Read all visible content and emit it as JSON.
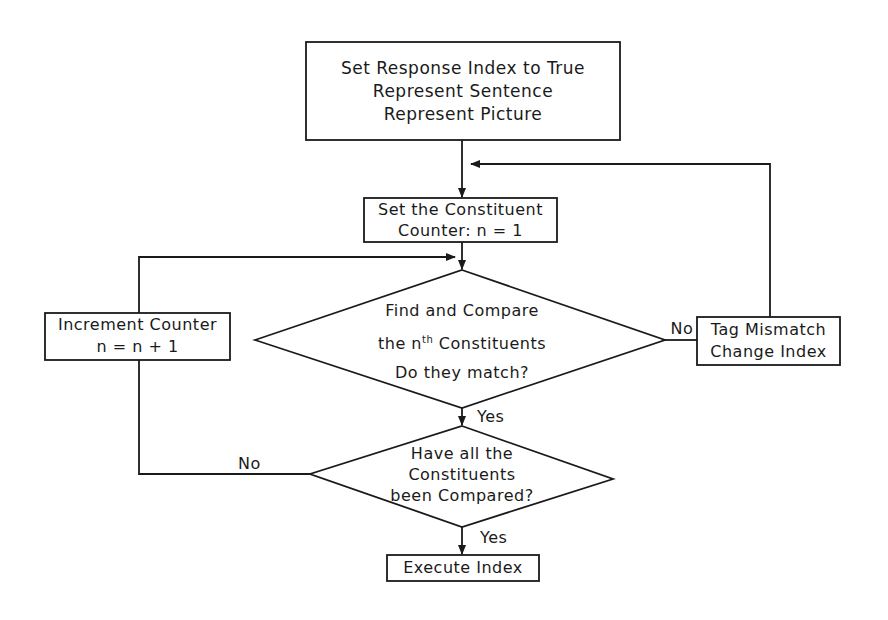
{
  "diagram": {
    "type": "flowchart",
    "nodes": {
      "start": {
        "shape": "rectangle",
        "lines": [
          "Set Response Index to True",
          "Represent Sentence",
          "Represent Picture"
        ]
      },
      "set_counter": {
        "shape": "rectangle",
        "lines": [
          "Set the Constituent",
          "Counter: n = 1"
        ]
      },
      "compare": {
        "shape": "diamond",
        "line1": "Find and Compare",
        "line2_pre": "the n",
        "line2_sup": "th",
        "line2_post": " Constituents",
        "line3": "Do they match?"
      },
      "tag_mismatch": {
        "shape": "rectangle",
        "lines": [
          "Tag Mismatch",
          "Change Index"
        ]
      },
      "increment": {
        "shape": "rectangle",
        "lines": [
          "Increment Counter",
          "n = n + 1"
        ]
      },
      "all_compared": {
        "shape": "diamond",
        "lines": [
          "Have all the",
          "Constituents",
          "been Compared?"
        ]
      },
      "execute": {
        "shape": "rectangle",
        "lines": [
          "Execute Index"
        ]
      }
    },
    "edge_labels": {
      "compare_no": "No",
      "compare_yes": "Yes",
      "all_compared_no": "No",
      "all_compared_yes": "Yes"
    },
    "edges": [
      {
        "from": "start",
        "to": "set_counter"
      },
      {
        "from": "set_counter",
        "to": "compare"
      },
      {
        "from": "compare",
        "to": "tag_mismatch",
        "label": "No"
      },
      {
        "from": "tag_mismatch",
        "to": "set_counter"
      },
      {
        "from": "compare",
        "to": "all_compared",
        "label": "Yes"
      },
      {
        "from": "all_compared",
        "to": "increment",
        "label": "No"
      },
      {
        "from": "increment",
        "to": "compare"
      },
      {
        "from": "all_compared",
        "to": "execute",
        "label": "Yes"
      }
    ],
    "colors": {
      "stroke": "#1a1a1a",
      "background": "#ffffff"
    }
  }
}
